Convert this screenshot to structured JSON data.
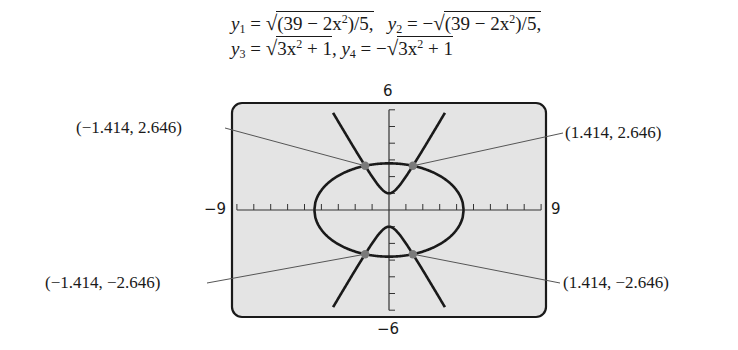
{
  "equations": {
    "line1": {
      "y1_lhs": "y",
      "y1_sub": "1",
      "y1_rad": "(39 − 2x",
      "y1_rad_tail": ")/5,",
      "y2_lhs": "y",
      "y2_sub": "2",
      "y2_rad": "(39 − 2x",
      "y2_rad_tail": ")/5,"
    },
    "line2": {
      "y3_lhs": "y",
      "y3_sub": "3",
      "y3_rad": "3x",
      "y3_rad_tail": " + 1",
      "y4_lhs": "y",
      "y4_sub": "4",
      "y4_rad": "3x",
      "y4_rad_tail": " + 1"
    },
    "text_full": [
      "y1 = √((39 − 2x²)/5),  y2 = −√((39 − 2x²)/5),",
      "y3 = √(3x² + 1),  y4 = −√(3x² + 1)"
    ]
  },
  "window": {
    "xmin_label": "−9",
    "xmax_label": "9",
    "ymin_label": "−6",
    "ymax_label": "6"
  },
  "point_labels": {
    "top_left": "(−1.414, 2.646)",
    "top_right": "(1.414, 2.646)",
    "bottom_left": "(−1.414, −2.646)",
    "bottom_right": "(1.414, −2.646)"
  },
  "colors": {
    "screen_bg": "#e4e4e4",
    "screen_border": "#1a1a1a",
    "curve": "#1a1a1a",
    "point": "#7a7a7a",
    "leader": "#555555"
  },
  "chart_data": {
    "type": "line",
    "xlabel": "",
    "ylabel": "",
    "xlim": [
      -9,
      9
    ],
    "ylim": [
      -6,
      6
    ],
    "xscale_ticks": 1,
    "yscale_ticks": 1,
    "grid": false,
    "series": [
      {
        "name": "y1",
        "expr": "sqrt((39-2x^2)/5)",
        "domain": [
          -4.416,
          4.416
        ]
      },
      {
        "name": "y2",
        "expr": "-sqrt((39-2x^2)/5)",
        "domain": [
          -4.416,
          4.416
        ]
      },
      {
        "name": "y3",
        "expr": "sqrt(3x^2+1)",
        "domain": [
          -3.31,
          3.31
        ]
      },
      {
        "name": "y4",
        "expr": "-sqrt(3x^2+1)",
        "domain": [
          -3.31,
          3.31
        ]
      }
    ],
    "intersection_points": [
      {
        "x": -1.414,
        "y": 2.646,
        "label": "(−1.414, 2.646)"
      },
      {
        "x": 1.414,
        "y": 2.646,
        "label": "(1.414, 2.646)"
      },
      {
        "x": -1.414,
        "y": -2.646,
        "label": "(−1.414, −2.646)"
      },
      {
        "x": 1.414,
        "y": -2.646,
        "label": "(1.414, −2.646)"
      }
    ]
  }
}
